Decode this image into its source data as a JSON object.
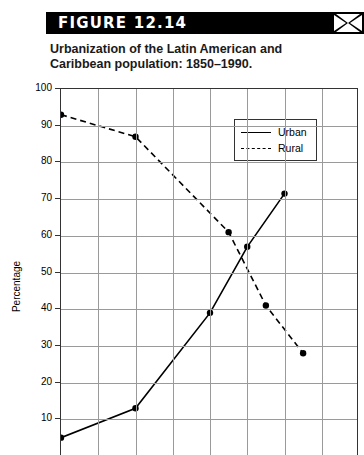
{
  "figure": {
    "bar_label": "FIGURE 12.14",
    "logo_icon": "x-logo-icon",
    "caption_line1": "Urbanization of the Latin American and",
    "caption_line2": "Caribbean population: 1850–1990."
  },
  "chart_data": {
    "type": "line",
    "title": "Urbanization of the Latin American and Caribbean population: 1850–1990.",
    "xlabel": "",
    "ylabel": "Percentage",
    "ylim": [
      0,
      100
    ],
    "ytick_labels": [
      "100",
      "90",
      "80",
      "70",
      "60",
      "50",
      "40",
      "30",
      "20",
      "10"
    ],
    "yticks": [
      100,
      90,
      80,
      70,
      60,
      50,
      40,
      30,
      20,
      10
    ],
    "xlim": [
      0,
      8
    ],
    "x": [
      0,
      2,
      4,
      5,
      6,
      7
    ],
    "xtick_labels": [],
    "grid": true,
    "legend_position": "upper-right",
    "series": [
      {
        "name": "Urban",
        "style": "solid",
        "values": [
          5,
          13,
          39,
          57,
          71.5,
          71.5
        ],
        "points": [
          {
            "x": 0,
            "y": 5
          },
          {
            "x": 2,
            "y": 13
          },
          {
            "x": 4,
            "y": 39
          },
          {
            "x": 5,
            "y": 57
          },
          {
            "x": 6,
            "y": 71.5
          }
        ]
      },
      {
        "name": "Rural",
        "style": "dashed",
        "values": [
          93,
          87,
          61,
          41,
          28,
          28
        ],
        "points": [
          {
            "x": 0,
            "y": 93
          },
          {
            "x": 2,
            "y": 87
          },
          {
            "x": 4.5,
            "y": 61
          },
          {
            "x": 5.5,
            "y": 41
          },
          {
            "x": 6.5,
            "y": 28
          }
        ]
      }
    ]
  },
  "legend": {
    "items": [
      {
        "label": "Urban",
        "style": "solid"
      },
      {
        "label": "Rural",
        "style": "dashed"
      }
    ]
  }
}
